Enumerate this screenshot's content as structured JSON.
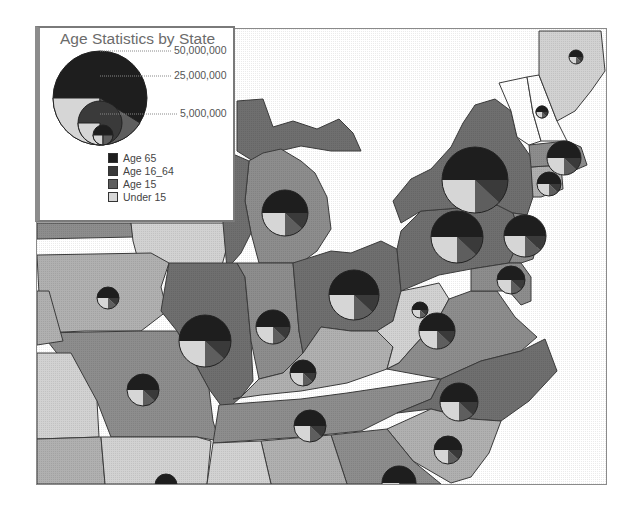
{
  "legend": {
    "title": "Age Statistics by State",
    "size_scale": [
      {
        "label": "50,000,000",
        "value": 50000000
      },
      {
        "label": "25,000,000",
        "value": 25000000
      },
      {
        "label": "5,000,000",
        "value": 5000000
      }
    ],
    "categories": [
      {
        "label": "Age 65",
        "color": "#1e1e1e"
      },
      {
        "label": "Age 16_64",
        "color": "#3a3a3a"
      },
      {
        "label": "Age 15",
        "color": "#5e5e5e"
      },
      {
        "label": "Under 15",
        "color": "#d6d6d6"
      }
    ]
  },
  "map": {
    "colors": {
      "water": "#ffffff",
      "dark_state": "#6f6f6f",
      "mid_state": "#8d8d8d",
      "light_state": "#b0b0b0",
      "pale_state": "#d2d2d2",
      "border": "#3c3c3c"
    },
    "pie_symbols": [
      {
        "region": "Iowa",
        "cx": 107,
        "cy": 297,
        "r": 11
      },
      {
        "region": "Illinois",
        "cx": 204,
        "cy": 340,
        "r": 26
      },
      {
        "region": "Indiana",
        "cx": 272,
        "cy": 326,
        "r": 17
      },
      {
        "region": "Missouri",
        "cx": 142,
        "cy": 389,
        "r": 16
      },
      {
        "region": "Michigan",
        "cx": 284,
        "cy": 212,
        "r": 23
      },
      {
        "region": "Ohio",
        "cx": 353,
        "cy": 294,
        "r": 25
      },
      {
        "region": "Kentucky",
        "cx": 302,
        "cy": 372,
        "r": 13
      },
      {
        "region": "Tennessee",
        "cx": 309,
        "cy": 425,
        "r": 16
      },
      {
        "region": "West Virginia",
        "cx": 419,
        "cy": 309,
        "r": 8
      },
      {
        "region": "Virginia",
        "cx": 436,
        "cy": 330,
        "r": 18
      },
      {
        "region": "North Carolina",
        "cx": 458,
        "cy": 401,
        "r": 19
      },
      {
        "region": "South Carolina",
        "cx": 447,
        "cy": 449,
        "r": 14
      },
      {
        "region": "Pennsylvania",
        "cx": 456,
        "cy": 236,
        "r": 26
      },
      {
        "region": "New York",
        "cx": 474,
        "cy": 179,
        "r": 33
      },
      {
        "region": "New Jersey",
        "cx": 524,
        "cy": 235,
        "r": 21
      },
      {
        "region": "Maryland",
        "cx": 510,
        "cy": 279,
        "r": 14
      },
      {
        "region": "Massachusetts",
        "cx": 563,
        "cy": 157,
        "r": 17
      },
      {
        "region": "Connecticut",
        "cx": 548,
        "cy": 183,
        "r": 12
      },
      {
        "region": "Vermont",
        "cx": 541,
        "cy": 111,
        "r": 6
      },
      {
        "region": "New Hampshire",
        "cx": 541,
        "cy": 111,
        "r": 6
      },
      {
        "region": "Maine",
        "cx": 575,
        "cy": 56,
        "r": 7
      },
      {
        "region": "Georgia",
        "cx": 398,
        "cy": 482,
        "r": 17
      },
      {
        "region": "Arkansas",
        "cx": 165,
        "cy": 484,
        "r": 11
      }
    ]
  }
}
